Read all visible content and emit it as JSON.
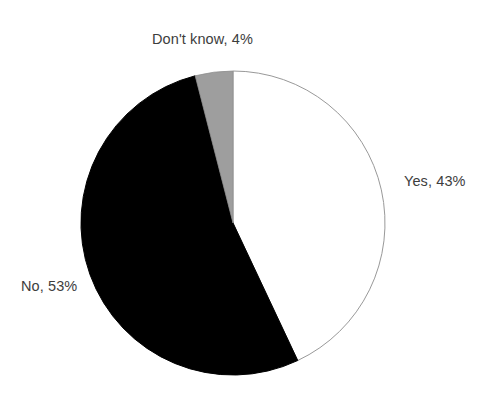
{
  "chart_data": {
    "type": "pie",
    "title": "",
    "subtitle": "",
    "xlabel": "",
    "ylabel": "",
    "legend_position": "none",
    "grid": false,
    "categories": [
      "Yes",
      "No",
      "Don't know"
    ],
    "values": [
      43,
      53,
      4
    ],
    "units": "%",
    "slices": [
      {
        "name": "Yes",
        "value": 43,
        "label": "Yes, 43%",
        "color": "#ffffff",
        "stroke": "#999999",
        "label_position": "right"
      },
      {
        "name": "No",
        "value": 53,
        "label": "No, 53%",
        "color": "#000000",
        "stroke": "#000000",
        "label_position": "left"
      },
      {
        "name": "Don't know",
        "value": 4,
        "label": "Don't know, 4%",
        "color": "#9e9e9e",
        "stroke": "#8f8f8f",
        "label_position": "top"
      }
    ],
    "start_angle_deg": 0,
    "direction": "clockwise",
    "center": {
      "x": 233,
      "y": 223
    },
    "radius": 152,
    "background": "#ffffff"
  },
  "labels": {
    "dont_know": "Don't know, 4%",
    "yes": "Yes, 43%",
    "no": "No, 53%"
  }
}
